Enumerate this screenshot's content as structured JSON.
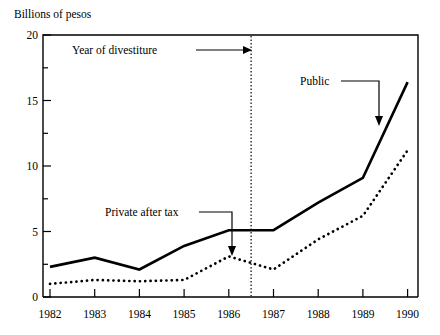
{
  "chart_data": {
    "type": "line",
    "title": "",
    "ylabel": "Billions of pesos",
    "xlabel": "",
    "categories": [
      "1982",
      "1983",
      "1984",
      "1985",
      "1986",
      "1987",
      "1988",
      "1989",
      "1990"
    ],
    "x": [
      1982,
      1983,
      1984,
      1985,
      1986,
      1987,
      1988,
      1989,
      1990
    ],
    "series": [
      {
        "name": "Public",
        "style": "solid",
        "values": [
          2.3,
          3.0,
          2.1,
          3.9,
          5.1,
          5.1,
          7.2,
          9.1,
          16.4
        ]
      },
      {
        "name": "Private after tax",
        "style": "dotted",
        "values": [
          1.0,
          1.3,
          1.2,
          1.3,
          3.1,
          2.1,
          4.4,
          6.2,
          11.2
        ]
      }
    ],
    "ylim": [
      0,
      20
    ],
    "y_ticks_major": [
      "0",
      "5",
      "10",
      "15",
      "20"
    ],
    "y_ticks_major_values": [
      0,
      5,
      10,
      15,
      20
    ],
    "y_ticks_minor_values": [
      2.5,
      7.5,
      12.5,
      17.5
    ],
    "grid": false,
    "legend": "none",
    "annotations": [
      {
        "id": "divestiture",
        "label": "Year of divestiture",
        "marker": "vertical-dotted-line",
        "at_x": 1986.5,
        "arrow": "right"
      },
      {
        "id": "public-series",
        "label": "Public",
        "arrow": "down",
        "points_to_series": "Public"
      },
      {
        "id": "private-series",
        "label": "Private after tax",
        "arrow": "down",
        "points_to_series": "Private after tax"
      }
    ]
  },
  "axes": {
    "y_axis_title": "Billions of pesos",
    "y_tick_labels": [
      "20",
      "15",
      "10",
      "5",
      "0"
    ],
    "x_tick_labels": [
      "1982",
      "1983",
      "1984",
      "1985",
      "1986",
      "1987",
      "1988",
      "1989",
      "1990"
    ]
  },
  "labels": {
    "year_of_divestiture": "Year of divestiture",
    "public": "Public",
    "private_after_tax": "Private after tax"
  },
  "colors": {
    "background": "#ffffff",
    "ink": "#000000"
  }
}
